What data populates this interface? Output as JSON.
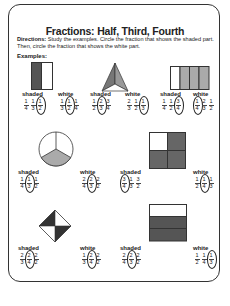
{
  "title": "Fractions: Half, Third, Fourth",
  "directions_label": "Directions:",
  "directions_text": "Study the examples. Circle the fraction that shows the shaded part. Then, circle the fraction that shows the white part.",
  "examples_label": "Examples:",
  "labels": {
    "shaded": "shaded",
    "white": "white"
  },
  "examples": [
    {
      "shape": "rectangle-halves",
      "shaded": [
        [
          "1",
          "4"
        ],
        [
          "1",
          "3"
        ],
        [
          "1",
          "2"
        ]
      ],
      "shaded_circled": 2,
      "white": [
        [
          "1",
          "3"
        ],
        [
          "1",
          "2"
        ],
        [
          "1",
          "4"
        ]
      ],
      "white_circled": 1
    },
    {
      "shape": "triangle-thirds",
      "shaded": [
        [
          "1",
          "2"
        ],
        [
          "2",
          "3"
        ],
        [
          "3",
          "4"
        ]
      ],
      "shaded_circled": 1,
      "white": [
        [
          "2",
          "3"
        ],
        [
          "1",
          "2"
        ],
        [
          "1",
          "3"
        ]
      ],
      "white_circled": 2
    },
    {
      "shape": "rectangle-fourths",
      "shaded": [
        [
          "1",
          "4"
        ],
        [
          "1",
          "2"
        ],
        [
          "3",
          "4"
        ]
      ],
      "shaded_circled": 2,
      "white": [
        [
          "1",
          "4"
        ],
        [
          "2",
          "3"
        ],
        [
          "1",
          "2"
        ]
      ],
      "white_circled": 0
    },
    {
      "shape": "circle-thirds",
      "shaded": [
        [
          "1",
          "4"
        ],
        [
          "1",
          "3"
        ],
        [
          "1",
          "2"
        ]
      ],
      "shaded_circled": 1,
      "white": [
        [
          "2",
          "4"
        ],
        [
          "2",
          "3"
        ],
        [
          "2",
          "2"
        ]
      ],
      "white_circled": 1
    },
    {
      "shape": "square-fourths",
      "shaded": [
        [
          "3",
          "4"
        ],
        [
          "1",
          "3"
        ],
        [
          "3",
          "2"
        ]
      ],
      "shaded_circled": 0,
      "white": [
        [
          "1",
          "2"
        ],
        [
          "1",
          "4"
        ],
        [
          "1",
          "3"
        ]
      ],
      "white_circled": 1
    },
    {
      "shape": "diamond-fourths",
      "shaded": [
        [
          "2",
          "3"
        ],
        [
          "2",
          "4"
        ],
        [
          "2",
          "2"
        ]
      ],
      "shaded_circled": 1,
      "white": [
        [
          "1",
          "3"
        ],
        [
          "2",
          "4"
        ],
        [
          "2",
          "2"
        ]
      ],
      "white_circled": 1
    },
    {
      "shape": "rectangle-thirds-rows",
      "shaded": [
        [
          "2",
          "4"
        ],
        [
          "2",
          "3"
        ],
        [
          "2",
          "2"
        ]
      ],
      "shaded_circled": 1,
      "white": [
        [
          "1",
          "2"
        ],
        [
          "1",
          "4"
        ],
        [
          "1",
          "3"
        ]
      ],
      "white_circled": 2
    }
  ],
  "colors": {
    "dark": "#555555",
    "gray": "#a9a9a9",
    "line": "#333333"
  }
}
